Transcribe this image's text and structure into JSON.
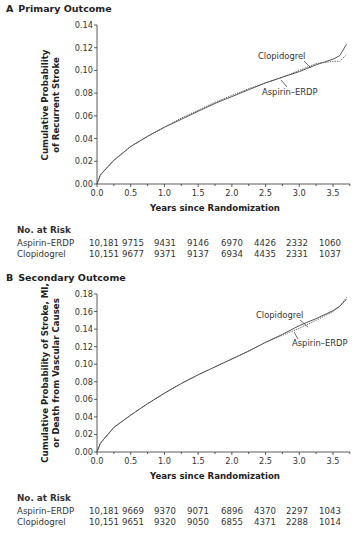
{
  "chart_data": [
    {
      "type": "line",
      "panel": "A",
      "title": "Primary Outcome",
      "xlabel": "Years since Randomization",
      "ylabel": [
        "Cumulative Probability",
        "of Recurrent Stroke"
      ],
      "xlim": [
        0,
        3.75
      ],
      "ylim": [
        0,
        0.14
      ],
      "xticks": [
        "0.0",
        "0.5",
        "1.0",
        "1.5",
        "2.0",
        "2.5",
        "3.0",
        "3.5"
      ],
      "yticks": [
        "0.00",
        "0.02",
        "0.04",
        "0.06",
        "0.08",
        "0.10",
        "0.12",
        "0.14"
      ],
      "grid": false,
      "series": [
        {
          "name": "Clopidogrel",
          "style": "solid",
          "x": [
            0,
            0.05,
            0.25,
            0.5,
            0.75,
            1.0,
            1.25,
            1.5,
            1.75,
            2.0,
            2.25,
            2.5,
            2.75,
            3.0,
            3.25,
            3.5,
            3.6,
            3.7
          ],
          "y": [
            0,
            0.008,
            0.021,
            0.033,
            0.042,
            0.05,
            0.057,
            0.064,
            0.071,
            0.077,
            0.083,
            0.089,
            0.094,
            0.099,
            0.105,
            0.11,
            0.113,
            0.123
          ]
        },
        {
          "name": "Aspirin–ERDP",
          "style": "dotted",
          "x": [
            0,
            0.05,
            0.25,
            0.5,
            0.75,
            1.0,
            1.25,
            1.5,
            1.75,
            2.0,
            2.25,
            2.5,
            2.75,
            3.0,
            3.25,
            3.5,
            3.6,
            3.7
          ],
          "y": [
            0,
            0.008,
            0.021,
            0.033,
            0.042,
            0.05,
            0.058,
            0.065,
            0.072,
            0.078,
            0.084,
            0.089,
            0.094,
            0.1,
            0.106,
            0.108,
            0.108,
            0.114
          ]
        }
      ],
      "annotations": [
        {
          "text": "Clopidogrel",
          "points_to": "Clopidogrel"
        },
        {
          "text": "Aspirin–ERDP",
          "points_to": "Aspirin–ERDP"
        }
      ],
      "risk_table": {
        "title": "No. at Risk",
        "rows": [
          {
            "label": "Aspirin–ERDP",
            "values": [
              "10,181",
              "9715",
              "9431",
              "9146",
              "6970",
              "4426",
              "2332",
              "1060"
            ]
          },
          {
            "label": "Clopidogrel",
            "values": [
              "10,151",
              "9677",
              "9371",
              "9137",
              "6934",
              "4435",
              "2331",
              "1037"
            ]
          }
        ]
      }
    },
    {
      "type": "line",
      "panel": "B",
      "title": "Secondary Outcome",
      "xlabel": "Years since Randomization",
      "ylabel": [
        "Cumulative Probability of Stroke, MI,",
        "or Death from Vascular Causes"
      ],
      "xlim": [
        0,
        3.75
      ],
      "ylim": [
        0,
        0.18
      ],
      "xticks": [
        "0.0",
        "0.5",
        "1.0",
        "1.5",
        "2.0",
        "2.5",
        "3.0",
        "3.5"
      ],
      "yticks": [
        "0.00",
        "0.02",
        "0.04",
        "0.06",
        "0.08",
        "0.10",
        "0.12",
        "0.14",
        "0.16",
        "0.18"
      ],
      "grid": false,
      "series": [
        {
          "name": "Clopidogrel",
          "style": "solid",
          "x": [
            0,
            0.05,
            0.25,
            0.5,
            0.75,
            1.0,
            1.25,
            1.5,
            1.75,
            2.0,
            2.25,
            2.5,
            2.75,
            3.0,
            3.25,
            3.5,
            3.6,
            3.7
          ],
          "y": [
            0,
            0.01,
            0.028,
            0.042,
            0.055,
            0.067,
            0.078,
            0.088,
            0.097,
            0.106,
            0.115,
            0.125,
            0.134,
            0.144,
            0.152,
            0.161,
            0.166,
            0.174
          ]
        },
        {
          "name": "Aspirin–ERDP",
          "style": "dotted",
          "x": [
            0,
            0.05,
            0.25,
            0.5,
            0.75,
            1.0,
            1.25,
            1.5,
            1.75,
            2.0,
            2.25,
            2.5,
            2.75,
            3.0,
            3.25,
            3.5,
            3.6,
            3.7
          ],
          "y": [
            0,
            0.01,
            0.028,
            0.042,
            0.055,
            0.067,
            0.078,
            0.088,
            0.097,
            0.106,
            0.115,
            0.125,
            0.133,
            0.141,
            0.15,
            0.16,
            0.166,
            0.176
          ]
        }
      ],
      "annotations": [
        {
          "text": "Clopidogrel",
          "points_to": "Clopidogrel"
        },
        {
          "text": "Aspirin–ERDP",
          "points_to": "Aspirin–ERDP"
        }
      ],
      "risk_table": {
        "title": "No. at Risk",
        "rows": [
          {
            "label": "Aspirin–ERDP",
            "values": [
              "10,181",
              "9669",
              "9370",
              "9071",
              "6896",
              "4370",
              "2297",
              "1043"
            ]
          },
          {
            "label": "Clopidogrel",
            "values": [
              "10,151",
              "9651",
              "9320",
              "9050",
              "6855",
              "4371",
              "2288",
              "1014"
            ]
          }
        ]
      }
    }
  ],
  "panels": {
    "a": {
      "letter": "A",
      "title": "Primary Outcome"
    },
    "b": {
      "letter": "B",
      "title": "Secondary Outcome"
    }
  },
  "colors": {
    "line": "#555555",
    "axis": "#333333",
    "text": "#222222"
  }
}
